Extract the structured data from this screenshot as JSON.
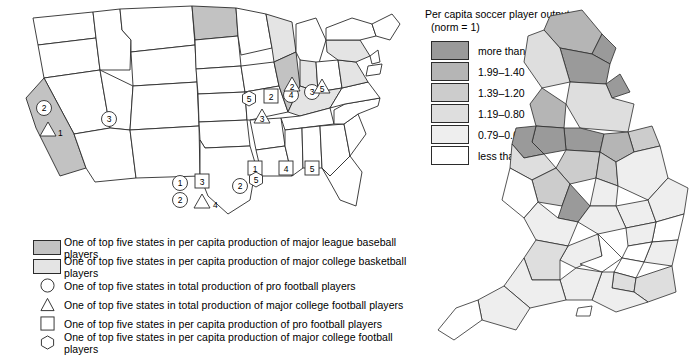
{
  "us_map": {
    "name": "united-states-map",
    "fill_dark": "#c2c2c2",
    "fill_light": "#e4e4e4",
    "fill_none": "#ffffff",
    "outline": "#2b2b2b",
    "markers": [
      {
        "shape": "circle",
        "label": "2",
        "x": 44,
        "y": 108
      },
      {
        "shape": "triangle",
        "label": "1",
        "x": 48,
        "y": 130
      },
      {
        "shape": "circle",
        "label": "3",
        "x": 109,
        "y": 119
      },
      {
        "shape": "hexagon",
        "label": "5",
        "x": 249,
        "y": 99
      },
      {
        "shape": "square",
        "label": "2",
        "x": 271,
        "y": 96
      },
      {
        "shape": "circle",
        "label": "4",
        "x": 291,
        "y": 95
      },
      {
        "shape": "circle",
        "label": "3",
        "x": 312,
        "y": 92
      },
      {
        "shape": "triangle",
        "label": "2",
        "x": 292,
        "y": 84
      },
      {
        "shape": "triangle",
        "label": "5",
        "x": 322,
        "y": 86
      },
      {
        "shape": "triangle",
        "label": "3",
        "x": 262,
        "y": 116
      },
      {
        "shape": "circle",
        "label": "1",
        "x": 180,
        "y": 183
      },
      {
        "shape": "square",
        "label": "3",
        "x": 202,
        "y": 181
      },
      {
        "shape": "circle",
        "label": "2",
        "x": 180,
        "y": 200
      },
      {
        "shape": "triangle",
        "label": "4",
        "x": 202,
        "y": 201
      },
      {
        "shape": "circle",
        "label": "2",
        "x": 240,
        "y": 186
      },
      {
        "shape": "square",
        "label": "1",
        "x": 255,
        "y": 168
      },
      {
        "shape": "hexagon",
        "label": "5",
        "x": 256,
        "y": 180
      },
      {
        "shape": "square",
        "label": "4",
        "x": 286,
        "y": 168
      },
      {
        "shape": "square",
        "label": "5",
        "x": 312,
        "y": 168
      }
    ],
    "legend": [
      {
        "key": "swatch-dark",
        "text": "One of top five states in per capita production of major league baseball players"
      },
      {
        "key": "swatch-light",
        "text": "One of top five states in per capita production of major college basketball players"
      },
      {
        "key": "circle",
        "text": "One of top five states in total production of pro football players"
      },
      {
        "key": "triangle",
        "text": "One of top five states in total production of major college football players"
      },
      {
        "key": "square",
        "text": "One of top five states in per capita production of pro football players"
      },
      {
        "key": "hexagon",
        "text": "One of top five states in per capita production of major college football players"
      }
    ]
  },
  "uk_map": {
    "name": "england-map",
    "legend_title_line1": "Per capita soccer player output",
    "legend_title_line2": "(norm = 1)",
    "classes": [
      {
        "color": "#9a9a9a",
        "label": "more than 2.00"
      },
      {
        "color": "#b5b5b5",
        "label": "1.99–1.40"
      },
      {
        "color": "#cccccc",
        "label": "1.39–1.20"
      },
      {
        "color": "#dedede",
        "label": "1.19–0.80"
      },
      {
        "color": "#eeeeee",
        "label": "0.79–0.60"
      },
      {
        "color": "#ffffff",
        "label": "less than 0.59"
      }
    ]
  }
}
